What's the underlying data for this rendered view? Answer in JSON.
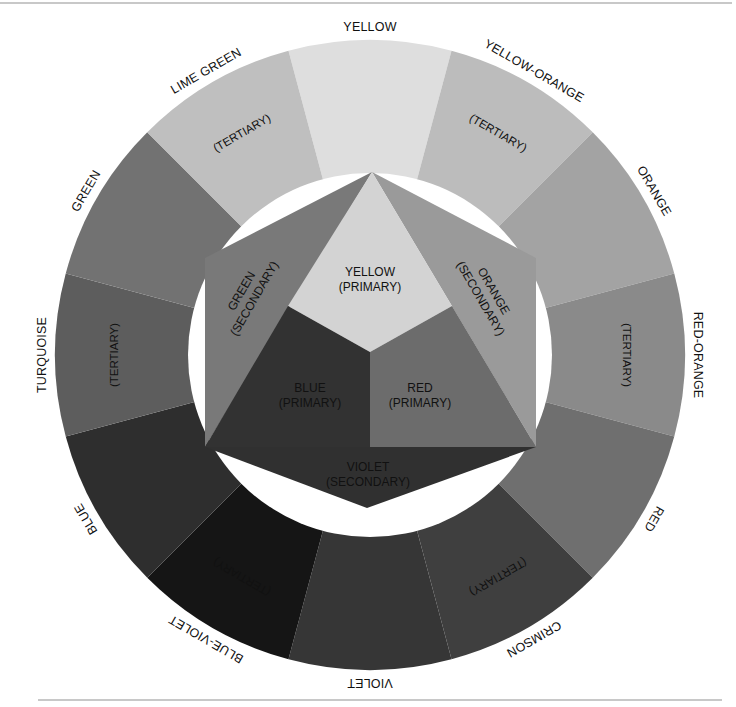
{
  "diagram": {
    "geometry": {
      "cx": 370,
      "cy": 355,
      "outer_r": 315,
      "inner_r": 182
    },
    "outer_ring": [
      {
        "name": "YELLOW",
        "type": "",
        "angle": -90,
        "color": "#dedede"
      },
      {
        "name": "YELLOW-ORANGE",
        "type": "(TERTIARY)",
        "angle": -60,
        "color": "#bcbcbc"
      },
      {
        "name": "ORANGE",
        "type": "",
        "angle": -30,
        "color": "#a3a3a3"
      },
      {
        "name": "RED-ORANGE",
        "type": "(TERTIARY)",
        "angle": 0,
        "color": "#8a8a8a"
      },
      {
        "name": "RED",
        "type": "",
        "angle": 30,
        "color": "#6f6f6f"
      },
      {
        "name": "CRIMSON",
        "type": "(TERTIARY)",
        "angle": 60,
        "color": "#3f3f3f"
      },
      {
        "name": "VIOLET",
        "type": "",
        "angle": 90,
        "color": "#363636"
      },
      {
        "name": "BLUE-VIOLET",
        "type": "(TERTIARY)",
        "angle": 120,
        "color": "#151515"
      },
      {
        "name": "BLUE",
        "type": "",
        "angle": 150,
        "color": "#2e2e2e"
      },
      {
        "name": "TURQUOISE",
        "type": "(TERTIARY)",
        "angle": 180,
        "color": "#5d5d5d"
      },
      {
        "name": "GREEN",
        "type": "",
        "angle": 210,
        "color": "#727272"
      },
      {
        "name": "LIME GREEN",
        "type": "(TERTIARY)",
        "angle": 240,
        "color": "#bfbfbf"
      }
    ],
    "inner_hexagon": {
      "primary": [
        {
          "name": "YELLOW",
          "type": "(PRIMARY)",
          "color": "#d3d3d3"
        },
        {
          "name": "RED",
          "type": "(PRIMARY)",
          "color": "#6c6c6c"
        },
        {
          "name": "BLUE",
          "type": "(PRIMARY)",
          "color": "#323232"
        }
      ],
      "secondary": [
        {
          "name": "ORANGE",
          "type": "(SECONDARY)",
          "color": "#9a9a9a"
        },
        {
          "name": "VIOLET",
          "type": "(SECONDARY)",
          "color": "#303030"
        },
        {
          "name": "GREEN",
          "type": "(SECONDARY)",
          "color": "#797979"
        }
      ]
    }
  }
}
